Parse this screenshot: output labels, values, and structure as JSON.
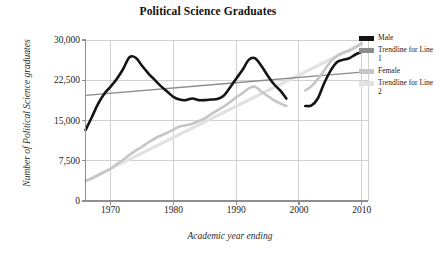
{
  "chart_data": {
    "type": "line",
    "title": "Political Science Graduates",
    "xlabel": "Academic year ending",
    "ylabel": "Number of Political Science graduates",
    "xlim": [
      1966,
      2011
    ],
    "ylim": [
      0,
      30000
    ],
    "grid": true,
    "legend_position": "right",
    "xticks": [
      1970,
      1980,
      1990,
      2000,
      2010
    ],
    "xtick_labels": [
      "1970",
      "1980",
      "1990",
      "2000",
      "2010"
    ],
    "yticks": [
      0,
      7500,
      15000,
      22500,
      30000
    ],
    "ytick_labels": [
      "0",
      "7,500",
      "15,000",
      "22,500",
      "30,000"
    ],
    "colors": {
      "male": "#141414",
      "trendline_1": "#8c8c8c",
      "female": "#c6c6c6",
      "trendline_2": "#e2e2e2"
    },
    "series": [
      {
        "name": "Male",
        "color": "#141414",
        "x": [
          1966,
          1967,
          1968,
          1969,
          1970,
          1971,
          1972,
          1973,
          1974,
          1975,
          1976,
          1977,
          1978,
          1979,
          1980,
          1981,
          1982,
          1983,
          1984,
          1985,
          1986,
          1987,
          1988,
          1989,
          1990,
          1991,
          1992,
          1993,
          1994,
          1995,
          1996,
          1997,
          1998
        ],
        "y": [
          13200,
          15600,
          18100,
          20000,
          21300,
          22800,
          24600,
          26800,
          26700,
          25200,
          23800,
          22600,
          21400,
          20400,
          19400,
          18900,
          18800,
          19100,
          18800,
          18800,
          18900,
          19000,
          19600,
          21100,
          22800,
          24400,
          26300,
          26600,
          25200,
          23400,
          21800,
          20600,
          19100
        ]
      },
      {
        "name": "Male",
        "color": "#141414",
        "segment": 2,
        "x": [
          2001,
          2002,
          2003,
          2004,
          2005,
          2006,
          2007,
          2008,
          2009,
          2010
        ],
        "y": [
          17700,
          17800,
          19100,
          21900,
          24200,
          25800,
          26300,
          26600,
          27300,
          27800
        ]
      },
      {
        "name": "Female",
        "color": "#c6c6c6",
        "x": [
          1966,
          1967,
          1968,
          1969,
          1970,
          1971,
          1972,
          1973,
          1974,
          1975,
          1976,
          1977,
          1978,
          1979,
          1980,
          1981,
          1982,
          1983,
          1984,
          1985,
          1986,
          1987,
          1988,
          1989,
          1990,
          1991,
          1992,
          1993,
          1994,
          1995,
          1996,
          1997,
          1998
        ],
        "y": [
          3800,
          4200,
          4800,
          5400,
          6000,
          6900,
          7700,
          8600,
          9400,
          10100,
          10900,
          11600,
          12200,
          12700,
          13300,
          13900,
          14100,
          14400,
          14900,
          15400,
          16200,
          16900,
          17600,
          18400,
          19300,
          20100,
          21000,
          21300,
          20400,
          19600,
          18800,
          18200,
          17700
        ]
      },
      {
        "name": "Female",
        "color": "#c6c6c6",
        "segment": 2,
        "x": [
          2001,
          2002,
          2003,
          2004,
          2005,
          2006,
          2007,
          2008,
          2009,
          2010
        ],
        "y": [
          20600,
          21400,
          22700,
          24300,
          25900,
          27000,
          27600,
          28000,
          28600,
          29400
        ]
      },
      {
        "name": "Trendline for Line 1",
        "color": "#8c8c8c",
        "x": [
          1966,
          2010
        ],
        "y": [
          19700,
          24000
        ]
      },
      {
        "name": "Trendline for Line 2",
        "color": "#e2e2e2",
        "x": [
          1966,
          2010
        ],
        "y": [
          3700,
          29300
        ]
      }
    ],
    "legend": [
      {
        "label": "Male",
        "color": "#141414"
      },
      {
        "label": "Trendline for Line 1",
        "color": "#8c8c8c"
      },
      {
        "label": "Female",
        "color": "#c6c6c6"
      },
      {
        "label": "Trendline for Line 2",
        "color": "#e2e2e2"
      }
    ]
  }
}
